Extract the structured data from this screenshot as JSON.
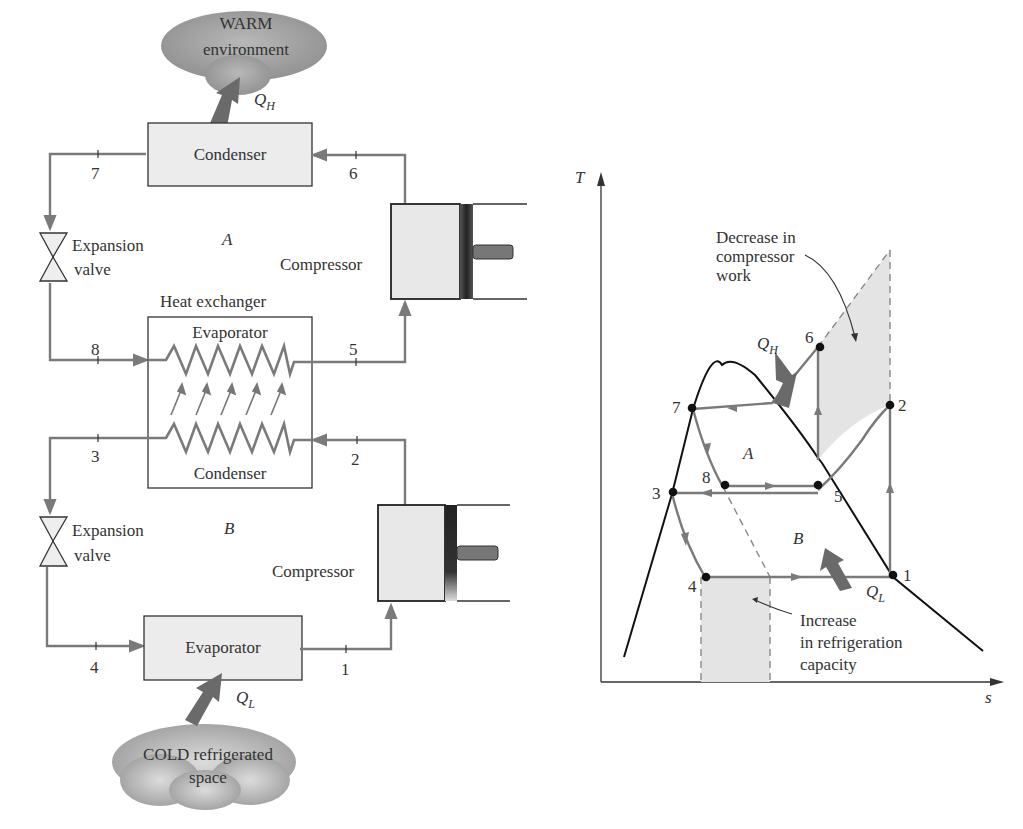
{
  "diagram": {
    "schematic": {
      "warm_environment": {
        "line1": "WARM",
        "line2": "environment"
      },
      "cold_space": {
        "line1": "COLD refrigerated",
        "line2": "space"
      },
      "heat_out": {
        "symbol": "Q",
        "subscript": "H"
      },
      "heat_in": {
        "symbol": "Q",
        "subscript": "L"
      },
      "upper_condenser": "Condenser",
      "lower_evaporator": "Evaporator",
      "heat_exchanger": {
        "label": "Heat exchanger",
        "top_coil": "Evaporator",
        "bottom_coil": "Condenser"
      },
      "expansion_valve_top": {
        "line1": "Expansion",
        "line2": "valve"
      },
      "expansion_valve_bottom": {
        "line1": "Expansion",
        "line2": "valve"
      },
      "compressor_top": "Compressor",
      "compressor_bottom": "Compressor",
      "cycle_A": "A",
      "cycle_B": "B",
      "state_points": [
        "1",
        "2",
        "3",
        "4",
        "5",
        "6",
        "7",
        "8"
      ]
    },
    "ts_chart": {
      "y_axis": "T",
      "x_axis": "s",
      "cycle_A": "A",
      "cycle_B": "B",
      "heat_out": {
        "symbol": "Q",
        "subscript": "H"
      },
      "heat_in": {
        "symbol": "Q",
        "subscript": "L"
      },
      "annotation_work": {
        "line1": "Decrease in",
        "line2": "compressor",
        "line3": "work"
      },
      "annotation_capacity": {
        "line1": "Increase",
        "line2": "in refrigeration",
        "line3": "capacity"
      },
      "points": {
        "p1": "1",
        "p2": "2",
        "p3": "3",
        "p4": "4",
        "p5": "5",
        "p6": "6",
        "p7": "7",
        "p8": "8"
      }
    }
  },
  "colors": {
    "line_gray": "#7a7a7a",
    "fill_light": "#e6e6e6",
    "cloud": "#a8a8a8",
    "arrow_dark": "#6a6a6a",
    "ink": "#1a1a1a"
  }
}
